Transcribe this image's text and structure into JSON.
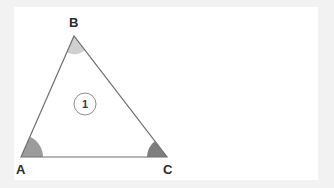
{
  "figure": {
    "canvas": {
      "width": 334,
      "height": 188
    },
    "background_color": "#f2f2f3",
    "card_color": "#ffffff",
    "stroke_color": "#6f6f6f",
    "stroke_width": 1.2
  },
  "vertices": [
    {
      "name": "A",
      "label": "A",
      "x": 21,
      "y": 157
    },
    {
      "name": "B",
      "label": "B",
      "x": 74,
      "y": 36
    },
    {
      "name": "C",
      "label": "C",
      "x": 167,
      "y": 157
    }
  ],
  "sides": [
    {
      "name": "AB",
      "from": "A",
      "to": "B"
    },
    {
      "name": "BC",
      "from": "B",
      "to": "C"
    },
    {
      "name": "CA",
      "from": "C",
      "to": "A"
    }
  ],
  "angle_marks": [
    {
      "vertex": "A",
      "fill": "#9c9c9c",
      "radius": 22
    },
    {
      "vertex": "B",
      "fill": "#d0d0d0",
      "radius": 18
    },
    {
      "vertex": "C",
      "fill": "#7f7f7f",
      "radius": 20
    }
  ],
  "region_labels": [
    {
      "name": "region-1",
      "text": "1",
      "x": 85,
      "y": 104,
      "circle_radius": 11,
      "circle_stroke": "#8c8c8c"
    }
  ],
  "chart_data": {
    "type": "diagram",
    "shape": "triangle",
    "points": {
      "A": [
        21,
        157
      ],
      "B": [
        74,
        36
      ],
      "C": [
        167,
        157
      ]
    },
    "edges": [
      [
        "A",
        "B"
      ],
      [
        "B",
        "C"
      ],
      [
        "C",
        "A"
      ]
    ],
    "annotations": [
      "A",
      "B",
      "C",
      "1"
    ],
    "angle_shading": {
      "A": "medium-gray",
      "B": "light-gray",
      "C": "dark-gray"
    },
    "legend": [],
    "grid": false
  }
}
